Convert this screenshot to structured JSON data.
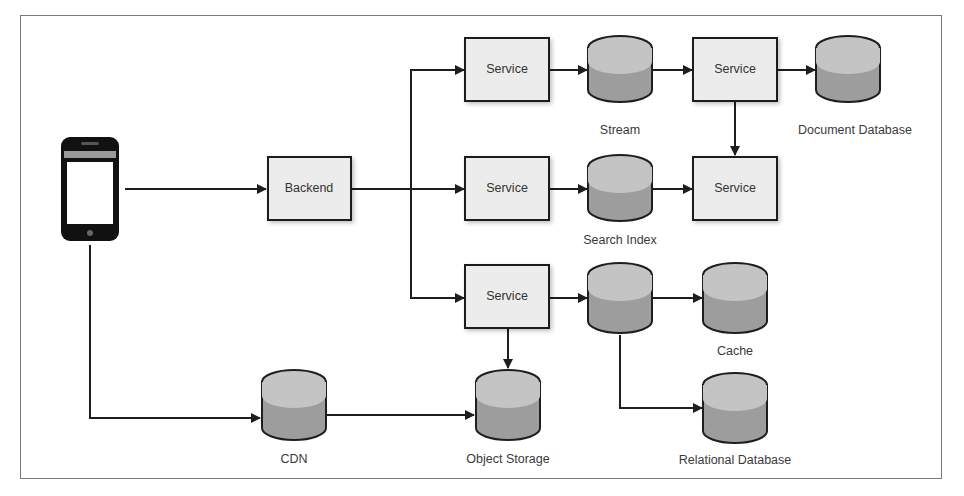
{
  "diagram": {
    "type": "architecture",
    "colors": {
      "box_fill": "#ececec",
      "box_stroke": "#1e1e1e",
      "db_top": "#c4c4c4",
      "db_body": "#9d9d9d",
      "db_stroke": "#1e1e1e",
      "arrow": "#1e1e1e",
      "frame": "#7a7a7a",
      "label": "#3a3a3a"
    },
    "nodes": {
      "client": {
        "kind": "mobile-phone"
      },
      "backend": {
        "kind": "box",
        "label": "Backend"
      },
      "service_top": {
        "kind": "box",
        "label": "Service"
      },
      "service_mid": {
        "kind": "box",
        "label": "Service"
      },
      "service_bottom": {
        "kind": "box",
        "label": "Service"
      },
      "service_top_right": {
        "kind": "box",
        "label": "Service"
      },
      "service_mid_right": {
        "kind": "box",
        "label": "Service"
      },
      "stream": {
        "kind": "database",
        "label": "Stream"
      },
      "document_db": {
        "kind": "database",
        "label": "Document Database"
      },
      "search_index": {
        "kind": "database",
        "label": "Search Index"
      },
      "unlabeled_db": {
        "kind": "database",
        "label": ""
      },
      "cache": {
        "kind": "database",
        "label": "Cache"
      },
      "relational_db": {
        "kind": "database",
        "label": "Relational Database"
      },
      "cdn": {
        "kind": "database",
        "label": "CDN"
      },
      "object_storage": {
        "kind": "database",
        "label": "Object Storage"
      }
    },
    "edges": [
      {
        "from": "client",
        "to": "backend"
      },
      {
        "from": "client",
        "to": "cdn"
      },
      {
        "from": "backend",
        "to": "service_top"
      },
      {
        "from": "backend",
        "to": "service_mid"
      },
      {
        "from": "backend",
        "to": "service_bottom"
      },
      {
        "from": "service_top",
        "to": "stream"
      },
      {
        "from": "stream",
        "to": "service_top_right"
      },
      {
        "from": "service_top_right",
        "to": "document_db"
      },
      {
        "from": "service_top_right",
        "to": "service_mid_right"
      },
      {
        "from": "service_mid",
        "to": "search_index"
      },
      {
        "from": "search_index",
        "to": "service_mid_right"
      },
      {
        "from": "service_bottom",
        "to": "unlabeled_db"
      },
      {
        "from": "service_bottom",
        "to": "object_storage"
      },
      {
        "from": "unlabeled_db",
        "to": "cache"
      },
      {
        "from": "unlabeled_db",
        "to": "relational_db"
      },
      {
        "from": "cdn",
        "to": "object_storage"
      }
    ]
  }
}
